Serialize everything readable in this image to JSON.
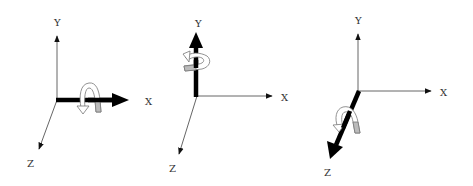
{
  "diagrams": [
    {
      "id": "rotation-about-x",
      "rotation_axis": "X",
      "labels": {
        "x": "X",
        "y": "Y",
        "z": "Z"
      }
    },
    {
      "id": "rotation-about-y",
      "rotation_axis": "Y",
      "labels": {
        "x": "X",
        "y": "Y",
        "z": "Z"
      }
    },
    {
      "id": "rotation-about-z",
      "rotation_axis": "Z",
      "labels": {
        "x": "X",
        "y": "Y",
        "z": "Z"
      }
    }
  ],
  "colors": {
    "axis": "#555555",
    "highlight_axis": "#000000",
    "rotation_arrow_fill": "#ffffff",
    "rotation_arrow_shade": "#bbbbbb",
    "rotation_arrow_stroke": "#777777"
  }
}
